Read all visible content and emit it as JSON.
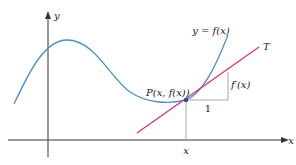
{
  "diagram": {
    "axes": {
      "x_label": "x",
      "y_label": "y"
    },
    "curve": {
      "label": "y = f(x)",
      "color": "#4a90c8"
    },
    "tangent": {
      "label": "T",
      "color": "#e0306a"
    },
    "point": {
      "label": "P(x, f(x))",
      "color": "#2a4a9a"
    },
    "drop_line_label": "x",
    "slope_triangle": {
      "run_label": "1",
      "rise_label": "f′(x)",
      "color": "#a0a0a0"
    },
    "axis_color": "#333333"
  }
}
